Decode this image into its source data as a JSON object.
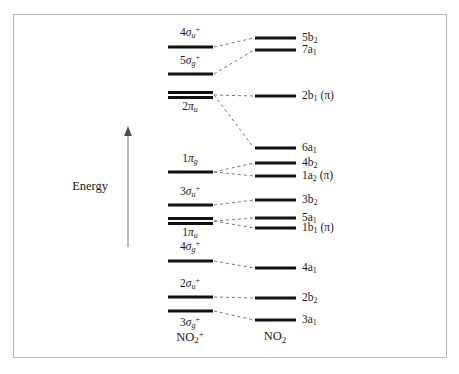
{
  "figure": {
    "energy_axis_label": "Energy",
    "energy_axis_direction": "up",
    "frame": true
  },
  "chart_data": {
    "type": "diagram",
    "subtype": "molecular-orbital-correlation-diagram",
    "title": "",
    "xlabel": "",
    "ylabel": "Energy",
    "ylim": [
      0,
      1
    ],
    "grid": false,
    "legend": "none",
    "columns": [
      {
        "id": "left",
        "species_label": "NO2+",
        "species_html": "NO<sub>2</sub><sup>+</sup>",
        "x_center": 190,
        "line_x1": 168,
        "line_x2": 213
      },
      {
        "id": "right",
        "species_label": "NO2",
        "species_html": "NO<sub>2</sub>",
        "x_center": 275,
        "line_x1": 255,
        "line_x2": 296
      }
    ],
    "left_levels": [
      {
        "id": "4su",
        "label": "4σu+",
        "label_html": "4<i>σ</i><sub><i>u</i></sub><sup>+</sup>",
        "y": 47,
        "label_y": 33,
        "degenerate": false
      },
      {
        "id": "5sg",
        "label": "5σg+",
        "label_html": "5<i>σ</i><sub><i>g</i></sub><sup>+</sup>",
        "y": 74,
        "label_y": 61,
        "degenerate": false
      },
      {
        "id": "2pu",
        "label": "2πu",
        "label_html": "2<i>π</i><sub><i>u</i></sub>",
        "y": 95,
        "label_y": 107,
        "degenerate": true
      },
      {
        "id": "1pg",
        "label": "1πg",
        "label_html": "1<i>π</i><sub><i>g</i></sub>",
        "y": 172,
        "label_y": 159,
        "degenerate": false
      },
      {
        "id": "3su",
        "label": "3σu+",
        "label_html": "3<i>σ</i><sub><i>u</i></sub><sup>+</sup>",
        "y": 205,
        "label_y": 192,
        "degenerate": false
      },
      {
        "id": "1pu",
        "label": "1πu",
        "label_html": "1<i>π</i><sub><i>u</i></sub>",
        "y": 221,
        "label_y": 233,
        "degenerate": true
      },
      {
        "id": "4sg",
        "label": "4σg+",
        "label_html": "4<i>σ</i><sub><i>g</i></sub><sup>+</sup>",
        "y": 261,
        "label_y": 247,
        "degenerate": false
      },
      {
        "id": "2su",
        "label": "2σu+",
        "label_html": "2<i>σ</i><sub><i>u</i></sub><sup>+</sup>",
        "y": 297,
        "label_y": 284,
        "degenerate": false
      },
      {
        "id": "3sg",
        "label": "3σg+",
        "label_html": "3<i>σ</i><sub><i>g</i></sub><sup>+</sup>",
        "y": 311,
        "label_y": 323,
        "degenerate": false
      }
    ],
    "right_levels": [
      {
        "id": "5b2",
        "label": "5b2",
        "label_html": "5b<sub>2</sub>",
        "y": 38
      },
      {
        "id": "7a1",
        "label": "7a1",
        "label_html": "7a<sub>1</sub>",
        "y": 50
      },
      {
        "id": "2b1",
        "label": "2b1 (π)",
        "label_html": "2b<sub>1</sub> (π)",
        "y": 96
      },
      {
        "id": "6a1",
        "label": "6a1",
        "label_html": "6a<sub>1</sub>",
        "y": 148
      },
      {
        "id": "4b2",
        "label": "4b2",
        "label_html": "4b<sub>2</sub>",
        "y": 163
      },
      {
        "id": "1a2",
        "label": "1a2 (π)",
        "label_html": "1a<sub>2</sub> (π)",
        "y": 176
      },
      {
        "id": "3b2",
        "label": "3b2",
        "label_html": "3b<sub>2</sub>",
        "y": 200
      },
      {
        "id": "5a1",
        "label": "5a1",
        "label_html": "5a<sub>1</sub>",
        "y": 218
      },
      {
        "id": "1b1",
        "label": "1b1 (π)",
        "label_html": "1b<sub>1</sub> (π)",
        "y": 228
      },
      {
        "id": "4a1",
        "label": "4a1",
        "label_html": "4a<sub>1</sub>",
        "y": 268
      },
      {
        "id": "2b2",
        "label": "2b2",
        "label_html": "2b<sub>2</sub>",
        "y": 298
      },
      {
        "id": "3a1",
        "label": "3a1",
        "label_html": "3a<sub>1</sub>",
        "y": 320
      }
    ],
    "correlations": [
      {
        "from": "4su",
        "to": "5b2"
      },
      {
        "from": "5sg",
        "to": "7a1"
      },
      {
        "from": "2pu",
        "to": "2b1"
      },
      {
        "from": "2pu",
        "to": "6a1"
      },
      {
        "from": "1pg",
        "to": "4b2"
      },
      {
        "from": "1pg",
        "to": "1a2"
      },
      {
        "from": "3su",
        "to": "3b2"
      },
      {
        "from": "1pu",
        "to": "5a1"
      },
      {
        "from": "1pu",
        "to": "1b1"
      },
      {
        "from": "4sg",
        "to": "4a1"
      },
      {
        "from": "2su",
        "to": "2b2"
      },
      {
        "from": "3sg",
        "to": "3a1"
      }
    ],
    "energy_axis": {
      "x": 128,
      "y_top": 131,
      "y_bottom": 247,
      "label_x": 108,
      "label_y": 186
    }
  },
  "colors": {
    "level_line": "#111111",
    "connector": "#777777",
    "frame": "#b9b9b9",
    "axis": "#8a8a8a",
    "text": "#1a1a1a",
    "background": "#ffffff"
  }
}
